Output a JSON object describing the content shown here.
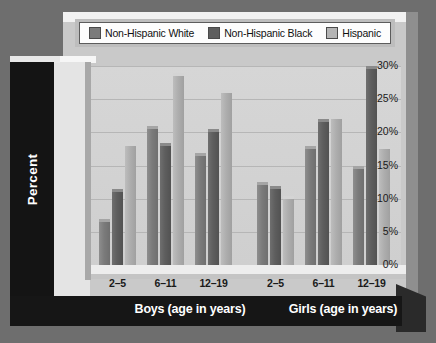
{
  "chart_data": {
    "type": "bar",
    "title": "",
    "xlabel": "",
    "ylabel": "Percent",
    "ylim": [
      0,
      30
    ],
    "ytick_labels": [
      "30%",
      "25%",
      "20%",
      "15%",
      "10%",
      "5%",
      "0%"
    ],
    "ytick_values": [
      30,
      25,
      20,
      15,
      10,
      5,
      0
    ],
    "grid": true,
    "legend_position": "top",
    "group_titles": [
      "Boys (age in years)",
      "Girls (age in years)"
    ],
    "categories": [
      "2–5",
      "6–11",
      "12–19",
      "2–5",
      "6–11",
      "12–19"
    ],
    "series": [
      {
        "name": "Non-Hispanic White",
        "color": "#7b7b7b",
        "values": [
          6.5,
          20.5,
          16.5,
          12.0,
          17.5,
          14.5
        ]
      },
      {
        "name": "Non-Hispanic Black",
        "color": "#5e5e5e",
        "values": [
          11.0,
          18.0,
          20.0,
          11.5,
          21.5,
          29.5
        ]
      },
      {
        "name": "Hispanic",
        "color": "#aeaeae",
        "values": [
          18.0,
          28.5,
          26.0,
          10.0,
          22.0,
          17.5
        ]
      }
    ]
  },
  "legend": {
    "items": [
      {
        "label": "Non-Hispanic White",
        "swatch": "#7b7b7b"
      },
      {
        "label": "Non-Hispanic Black",
        "swatch": "#5e5e5e"
      },
      {
        "label": "Hispanic",
        "swatch": "#b4b4b4"
      }
    ]
  },
  "axis": {
    "y_title": "Percent"
  },
  "colors": {
    "page_background": "#6e6e6e",
    "panel": "#c9c9c9",
    "plot_background": "#d2d2d2",
    "axis_block": "#161616",
    "gridline": "#b6b6b6"
  }
}
